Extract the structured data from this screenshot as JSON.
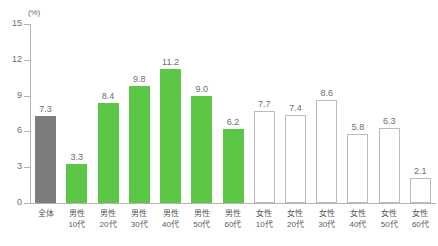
{
  "chart_data": {
    "type": "bar",
    "title": "",
    "subtitle": "",
    "xlabel": "",
    "ylabel": "",
    "unit_label": "(%)",
    "ylim": [
      0,
      15
    ],
    "yticks": [
      0,
      3,
      6,
      9,
      12,
      15
    ],
    "ytick_labels": [
      "0",
      "3",
      "6",
      "9",
      "12",
      "15"
    ],
    "grid": false,
    "legend": "none",
    "categories": [
      "全体",
      "男性10代",
      "男性20代",
      "男性30代",
      "男性40代",
      "男性50代",
      "男性60代",
      "女性10代",
      "女性20代",
      "女性30代",
      "女性40代",
      "女性50代",
      "女性60代"
    ],
    "category_lines": [
      [
        "全体",
        ""
      ],
      [
        "男性",
        "10代"
      ],
      [
        "男性",
        "20代"
      ],
      [
        "男性",
        "30代"
      ],
      [
        "男性",
        "40代"
      ],
      [
        "男性",
        "50代"
      ],
      [
        "男性",
        "60代"
      ],
      [
        "女性",
        "10代"
      ],
      [
        "女性",
        "20代"
      ],
      [
        "女性",
        "30代"
      ],
      [
        "女性",
        "40代"
      ],
      [
        "女性",
        "50代"
      ],
      [
        "女性",
        "60代"
      ]
    ],
    "values": [
      7.3,
      3.3,
      8.4,
      9.8,
      11.2,
      9.0,
      6.2,
      7.7,
      7.4,
      8.6,
      5.8,
      6.3,
      2.1
    ],
    "value_labels": [
      "7.3",
      "3.3",
      "8.4",
      "9.8",
      "11.2",
      "9.0",
      "6.2",
      "7.7",
      "7.4",
      "8.6",
      "5.8",
      "6.3",
      "2.1"
    ],
    "bar_styles": [
      "gray",
      "green",
      "green",
      "green",
      "green",
      "green",
      "green",
      "white",
      "white",
      "white",
      "white",
      "white",
      "white"
    ],
    "colors": {
      "gray": "#7d7d7d",
      "green": "#5cc747",
      "white": "#ffffff",
      "white_border": "#bcbcbc",
      "axis": "#b4b4b4",
      "text": "#6e6e6e"
    }
  }
}
